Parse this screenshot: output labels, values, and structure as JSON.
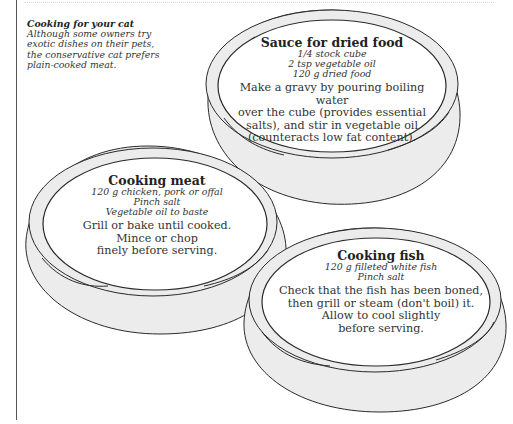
{
  "intro": {
    "title": "Cooking for your cat",
    "body_lines": [
      "Although some owners try",
      "exotic dishes on their pets,",
      "the conservative cat prefers",
      "plain-cooked meat."
    ]
  },
  "bowls": [
    {
      "id": "sauce",
      "heading": "Sauce for dried food",
      "ingredients": [
        "1/4 stock cube",
        "2 tsp vegetable oil",
        "120 g dried food"
      ],
      "method_lines": [
        "Make a gravy by pouring boiling water",
        "over the cube (provides essential",
        "salts), and stir in vegetable oil",
        "(counteracts low fat content)."
      ]
    },
    {
      "id": "meat",
      "heading": "Cooking meat",
      "ingredients": [
        "120 g chicken, pork or offal",
        "Pinch salt",
        "Vegetable oil to baste"
      ],
      "method_lines": [
        "Grill or bake until cooked.",
        "Mince or chop",
        "finely before serving."
      ]
    },
    {
      "id": "fish",
      "heading": "Cooking fish",
      "ingredients": [
        "120 g filleted white fish",
        "Pinch salt"
      ],
      "method_lines": [
        "Check that the fish has been boned,",
        "then grill or steam (don't boil) it.",
        "Allow to cool slightly",
        "before serving."
      ]
    }
  ],
  "colors": {
    "bowl_fill": "#ececec",
    "bowl_stroke": "#2a2a2a",
    "dish_fill": "#ffffff",
    "text": "#2a2a2a"
  }
}
